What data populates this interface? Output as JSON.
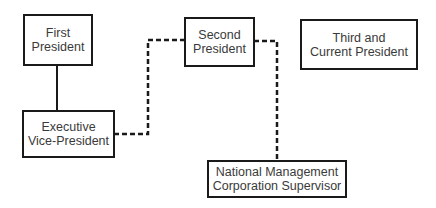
{
  "diagram": {
    "type": "organization-chart",
    "nodes": [
      {
        "id": "first",
        "lines": [
          "First",
          "President"
        ]
      },
      {
        "id": "evp",
        "lines": [
          "Executive",
          "Vice-President"
        ]
      },
      {
        "id": "second",
        "lines": [
          "Second",
          "President"
        ]
      },
      {
        "id": "third",
        "lines": [
          "Third and",
          "Current President"
        ]
      },
      {
        "id": "nmcs",
        "lines": [
          "National Management",
          "Corporation Supervisor"
        ]
      }
    ],
    "edges": [
      {
        "from": "first",
        "to": "evp",
        "style": "solid"
      },
      {
        "from": "evp",
        "to": "second",
        "style": "dashed"
      },
      {
        "from": "second",
        "to": "nmcs",
        "style": "dashed"
      }
    ],
    "colors": {
      "line": "#1a1a1a",
      "text": "#3a3a3a",
      "background": "#ffffff"
    }
  }
}
